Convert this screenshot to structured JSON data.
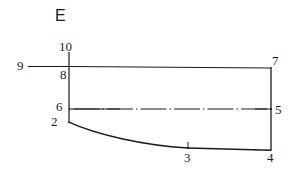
{
  "figure": {
    "section_label": "E",
    "background_color": "#ffffff",
    "line_color": "#1a1a1a",
    "width": 291,
    "height": 175,
    "labels": [
      {
        "id": "section-e",
        "text": "E",
        "x": 55,
        "y": 8,
        "kind": "section"
      },
      {
        "id": "point-10",
        "text": "10",
        "x": 59,
        "y": 40,
        "kind": "number"
      },
      {
        "id": "point-9",
        "text": "9",
        "x": 17,
        "y": 59,
        "kind": "number"
      },
      {
        "id": "point-8",
        "text": "8",
        "x": 59,
        "y": 68,
        "kind": "number"
      },
      {
        "id": "point-7",
        "text": "7",
        "x": 272,
        "y": 54,
        "kind": "number"
      },
      {
        "id": "point-6",
        "text": "6",
        "x": 55,
        "y": 99,
        "kind": "number"
      },
      {
        "id": "point-5",
        "text": "5",
        "x": 274,
        "y": 103,
        "kind": "number"
      },
      {
        "id": "point-2",
        "text": "2",
        "x": 50,
        "y": 115,
        "kind": "number"
      },
      {
        "id": "point-3",
        "text": "3",
        "x": 184,
        "y": 150,
        "kind": "number"
      },
      {
        "id": "point-4",
        "text": "4",
        "x": 267,
        "y": 150,
        "kind": "number"
      }
    ],
    "geometry": {
      "top_line": {
        "from": [
          69,
          66
        ],
        "to": [
          271,
          68
        ]
      },
      "left_vertical": {
        "from": [
          69,
          52
        ],
        "to": [
          69,
          123
        ]
      },
      "right_vertical": {
        "from": [
          271,
          67
        ],
        "to": [
          271,
          150
        ]
      },
      "extension_line_9": {
        "from": [
          28,
          66
        ],
        "to": [
          69,
          66
        ]
      },
      "centerline": {
        "from": [
          69,
          109
        ],
        "to": [
          272,
          109
        ],
        "style": "dash-dot"
      },
      "bottom_curve": {
        "start": [
          69,
          122
        ],
        "control1": [
          96,
          134
        ],
        "control2": [
          143,
          145
        ],
        "end": [
          188,
          148
        ]
      },
      "bottom_line": {
        "from": [
          188,
          148
        ],
        "to": [
          271,
          150
        ]
      },
      "tick_3": {
        "from": [
          188,
          143
        ],
        "to": [
          188,
          149
        ]
      }
    }
  }
}
